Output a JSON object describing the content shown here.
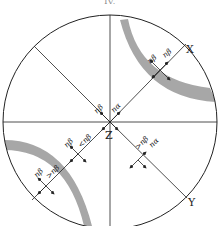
{
  "figure": {
    "caption_fragment": "IV.",
    "axes": {
      "x": "X",
      "y": "Y",
      "z": "Z"
    },
    "labels": {
      "upper_right_1": "nβ",
      "upper_right_2": "nβ",
      "center_1": "nβ",
      "center_2": "nα",
      "lower_left_inner_1": "nβ",
      "lower_left_inner_2": "<nβ",
      "lower_left_outer_1": "nβ",
      "lower_left_outer_2": ">nβ",
      "lower_right_1": ">nβ",
      "lower_right_2": "nα"
    },
    "colors": {
      "line": "#222222",
      "shade": "#8a8a8a"
    }
  }
}
